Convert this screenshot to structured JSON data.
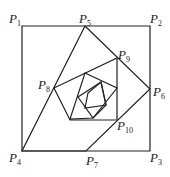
{
  "diagram": {
    "type": "nested rotated squares spiral",
    "stroke_color": "#222222",
    "labels": [
      {
        "base": "P",
        "sub": "1",
        "x": 9,
        "y": 12
      },
      {
        "base": "P",
        "sub": "5",
        "x": 79,
        "y": 12
      },
      {
        "base": "P",
        "sub": "2",
        "x": 150,
        "y": 12
      },
      {
        "base": "P",
        "sub": "9",
        "x": 118,
        "y": 48
      },
      {
        "base": "P",
        "sub": "8",
        "x": 38,
        "y": 78
      },
      {
        "base": "P",
        "sub": "6",
        "x": 153,
        "y": 85
      },
      {
        "base": "P",
        "sub": "10",
        "x": 117,
        "y": 119
      },
      {
        "base": "P",
        "sub": "4",
        "x": 9,
        "y": 151
      },
      {
        "base": "P",
        "sub": "7",
        "x": 86,
        "y": 154
      },
      {
        "base": "P",
        "sub": "3",
        "x": 150,
        "y": 151
      }
    ],
    "polygons": [
      "22,26 150,26 150,151 22,151",
      "85,26 150,89 86,151 22,151",
      "54,88 117,58 117,120 70,120",
      "85,73 117,88 93,118 70,119",
      "78,97 101,82 106,105 93,118",
      "88,93 101,82 106,105 85,108"
    ]
  }
}
